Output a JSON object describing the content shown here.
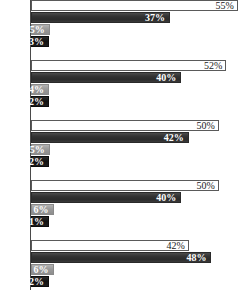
{
  "chart_data": {
    "type": "bar",
    "orientation": "horizontal",
    "title": "",
    "subtitle": "",
    "xlabel": "",
    "ylabel": "",
    "xlim": [
      0,
      58
    ],
    "grid": false,
    "legend_position": "none",
    "categories": [
      "Group 1",
      "Group 2",
      "Group 3",
      "Group 4",
      "Group 5"
    ],
    "series": [
      {
        "name": "Series 1",
        "color": "#ffffff",
        "values": [
          55,
          52,
          50,
          50,
          42
        ],
        "labels": [
          "55%",
          "52%",
          "50%",
          "50%",
          "42%"
        ]
      },
      {
        "name": "Series 2",
        "color": "#343434",
        "values": [
          37,
          40,
          42,
          40,
          48
        ],
        "labels": [
          "37%",
          "40%",
          "42%",
          "40%",
          "48%"
        ]
      },
      {
        "name": "Series 3",
        "color": "#9a9a9a",
        "values": [
          5,
          4,
          5,
          6,
          6
        ],
        "labels": [
          "5%",
          "4%",
          "5%",
          "6%",
          "6%"
        ]
      },
      {
        "name": "Series 4",
        "color": "#121212",
        "values": [
          3,
          2,
          2,
          1,
          2
        ],
        "labels": [
          "3%",
          "2%",
          "2%",
          "1%",
          "2%"
        ]
      }
    ]
  },
  "groups": [
    {
      "name": "group-1",
      "bars": [
        {
          "series": 1,
          "label": "55%",
          "value": 55
        },
        {
          "series": 2,
          "label": "37%",
          "value": 37
        },
        {
          "series": 3,
          "label": "5%",
          "value": 5
        },
        {
          "series": 4,
          "label": "3%",
          "value": 3
        }
      ]
    },
    {
      "name": "group-2",
      "bars": [
        {
          "series": 1,
          "label": "52%",
          "value": 52
        },
        {
          "series": 2,
          "label": "40%",
          "value": 40
        },
        {
          "series": 3,
          "label": "4%",
          "value": 4
        },
        {
          "series": 4,
          "label": "2%",
          "value": 2
        }
      ]
    },
    {
      "name": "group-3",
      "bars": [
        {
          "series": 1,
          "label": "50%",
          "value": 50
        },
        {
          "series": 2,
          "label": "42%",
          "value": 42
        },
        {
          "series": 3,
          "label": "5%",
          "value": 5
        },
        {
          "series": 4,
          "label": "2%",
          "value": 2
        }
      ]
    },
    {
      "name": "group-4",
      "bars": [
        {
          "series": 1,
          "label": "50%",
          "value": 50
        },
        {
          "series": 2,
          "label": "40%",
          "value": 40
        },
        {
          "series": 3,
          "label": "6%",
          "value": 6
        },
        {
          "series": 4,
          "label": "1%",
          "value": 1
        }
      ]
    },
    {
      "name": "group-5",
      "bars": [
        {
          "series": 1,
          "label": "42%",
          "value": 42
        },
        {
          "series": 2,
          "label": "48%",
          "value": 48
        },
        {
          "series": 3,
          "label": "6%",
          "value": 6
        },
        {
          "series": 4,
          "label": "2%",
          "value": 2
        }
      ]
    }
  ],
  "layout": {
    "bar_height_px": 11,
    "bar_gap_px": 1,
    "group_gap_px": 12,
    "plot_left_px": 31,
    "plot_width_px": 218,
    "axis_color": "#4a4a4a"
  }
}
